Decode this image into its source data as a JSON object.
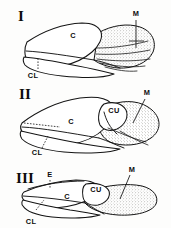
{
  "plate": {
    "title": "Hemipteran forewing structure comparison",
    "background_color": "#fdfdfc",
    "ink_color": "#141414",
    "stipple_color": "#b9b9b4",
    "figure_count": 3
  },
  "figures": [
    {
      "id": "figure-1",
      "numeral": "I",
      "numeral_x": 18,
      "numeral_y": 21,
      "labels": [
        {
          "name": "corium",
          "text": "C",
          "x": 73,
          "y": 38
        },
        {
          "name": "clavus",
          "text": "CL",
          "x": 33,
          "y": 73
        },
        {
          "name": "membrane",
          "text": "M",
          "x": 136,
          "y": 16
        }
      ],
      "regions": [
        "corium",
        "clavus",
        "membrane"
      ],
      "membrane_veins": 5,
      "has_cuneus": false,
      "has_embolium": false
    },
    {
      "id": "figure-2",
      "numeral": "II",
      "numeral_x": 19,
      "numeral_y": 99,
      "labels": [
        {
          "name": "corium",
          "text": "C",
          "x": 71,
          "y": 121
        },
        {
          "name": "clavus",
          "text": "CL",
          "x": 37,
          "y": 144
        },
        {
          "name": "cuneus",
          "text": "CU",
          "x": 115,
          "y": 110
        },
        {
          "name": "membrane",
          "text": "M",
          "x": 147,
          "y": 94
        }
      ],
      "regions": [
        "corium",
        "clavus",
        "cuneus",
        "membrane"
      ],
      "membrane_veins": 2,
      "has_cuneus": true,
      "has_embolium": false
    },
    {
      "id": "figure-3",
      "numeral": "III",
      "numeral_x": 16,
      "numeral_y": 183,
      "labels": [
        {
          "name": "embolium",
          "text": "E",
          "x": 50,
          "y": 177
        },
        {
          "name": "corium",
          "text": "C",
          "x": 67,
          "y": 198
        },
        {
          "name": "clavus",
          "text": "CL",
          "x": 31,
          "y": 217
        },
        {
          "name": "cuneus",
          "text": "CU",
          "x": 96,
          "y": 190
        },
        {
          "name": "membrane",
          "text": "M",
          "x": 132,
          "y": 171
        }
      ],
      "regions": [
        "embolium",
        "corium",
        "clavus",
        "cuneus",
        "membrane"
      ],
      "membrane_veins": 0,
      "has_cuneus": true,
      "has_embolium": true
    }
  ],
  "legend_keys": [
    {
      "abbr": "C",
      "meaning": "corium"
    },
    {
      "abbr": "CL",
      "meaning": "clavus"
    },
    {
      "abbr": "CU",
      "meaning": "cuneus"
    },
    {
      "abbr": "M",
      "meaning": "membrane"
    },
    {
      "abbr": "E",
      "meaning": "embolium"
    }
  ]
}
